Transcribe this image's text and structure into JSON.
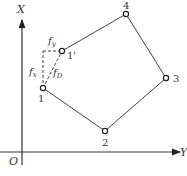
{
  "axes": {
    "vertical_label": "X",
    "horizontal_label": "Y",
    "origin_label": "O"
  },
  "points": [
    {
      "id": "1",
      "label": "1",
      "x": 43,
      "y": 88
    },
    {
      "id": "2",
      "label": "2",
      "x": 105,
      "y": 131
    },
    {
      "id": "3",
      "label": "3",
      "x": 166,
      "y": 78
    },
    {
      "id": "4",
      "label": "4",
      "x": 126,
      "y": 14
    },
    {
      "id": "1p",
      "label": "1'",
      "x": 62,
      "y": 51
    }
  ],
  "polygon_order": [
    "1",
    "2",
    "3",
    "4",
    "1p"
  ],
  "annotations": {
    "fx_label": "f",
    "fx_sub": "x",
    "fy_label": "f",
    "fy_sub": "y",
    "fd_label": "f",
    "fd_sub": "D"
  },
  "colors": {
    "line": "#444444",
    "text": "#333333"
  }
}
